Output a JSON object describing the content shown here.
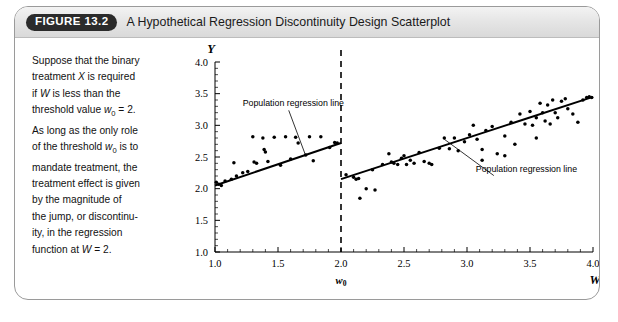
{
  "figure": {
    "badge": "FIGURE 13.2",
    "title": "A Hypothetical Regression Discontinuity Design Scatterplot",
    "caption_lines": [
      "Suppose that the binary",
      "treatment X is required",
      "if W is less than the",
      "threshold value w0 = 2.",
      "As long as the only role",
      "of the threshold w0 is to",
      "mandate treatment, the",
      "treatment effect is given",
      "by the magnitude of",
      "the jump, or discontinu-",
      "ity, in the regression",
      "function at W = 2."
    ]
  },
  "colors": {
    "badge_bg": "#2b2b2b",
    "header_bg": "#e6e6e6",
    "card_border": "#9a9a9a",
    "ink": "#000000"
  },
  "chart_data": {
    "type": "scatter",
    "title": "A Hypothetical Regression Discontinuity Design Scatterplot",
    "xlabel": "W",
    "ylabel": "Y",
    "xlim": [
      1.0,
      4.0
    ],
    "ylim": [
      1.0,
      4.0
    ],
    "xticks": [
      "1.0",
      "1.5",
      "2.0",
      "2.5",
      "3.0",
      "3.5",
      "4.0"
    ],
    "xtick_values": [
      1.0,
      1.5,
      2.0,
      2.5,
      3.0,
      3.5,
      4.0
    ],
    "yticks": [
      "1.0",
      "1.5",
      "2.0",
      "2.5",
      "3.0",
      "3.5",
      "4.0"
    ],
    "ytick_values": [
      1.0,
      1.5,
      2.0,
      2.5,
      3.0,
      3.5,
      4.0
    ],
    "grid": false,
    "threshold": {
      "label": "w0",
      "value": 2.0,
      "style": "dashed-vertical"
    },
    "annotations": [
      {
        "text": "Population regression line",
        "x": 1.22,
        "y": 3.3,
        "pointer_to": [
          1.72,
          2.52
        ]
      },
      {
        "text": "Population regression line",
        "x": 3.07,
        "y": 2.27,
        "pointer_to": [
          2.82,
          2.78
        ]
      }
    ],
    "series": [
      {
        "name": "Population regression line (W < 2)",
        "type": "line",
        "segment": [
          [
            1.0,
            2.05
          ],
          [
            2.0,
            2.72
          ]
        ]
      },
      {
        "name": "Population regression line (W >= 2)",
        "type": "line",
        "segment": [
          [
            2.0,
            2.15
          ],
          [
            4.0,
            3.45
          ]
        ]
      },
      {
        "name": "Observations (W < 2)",
        "type": "scatter",
        "points": [
          [
            1.01,
            2.1
          ],
          [
            1.03,
            2.07
          ],
          [
            1.05,
            2.05
          ],
          [
            1.08,
            2.12
          ],
          [
            1.13,
            2.15
          ],
          [
            1.15,
            2.41
          ],
          [
            1.17,
            2.2
          ],
          [
            1.22,
            2.25
          ],
          [
            1.26,
            2.27
          ],
          [
            1.3,
            2.82
          ],
          [
            1.31,
            2.42
          ],
          [
            1.33,
            2.4
          ],
          [
            1.38,
            2.8
          ],
          [
            1.39,
            2.62
          ],
          [
            1.4,
            2.58
          ],
          [
            1.42,
            2.43
          ],
          [
            1.47,
            2.81
          ],
          [
            1.52,
            2.37
          ],
          [
            1.56,
            2.82
          ],
          [
            1.6,
            2.47
          ],
          [
            1.64,
            2.81
          ],
          [
            1.66,
            2.72
          ],
          [
            1.72,
            2.53
          ],
          [
            1.75,
            2.82
          ],
          [
            1.78,
            2.44
          ],
          [
            1.84,
            2.82
          ],
          [
            1.91,
            2.65
          ],
          [
            1.95,
            2.73
          ],
          [
            1.97,
            2.72
          ]
        ]
      },
      {
        "name": "Observations (W >= 2)",
        "type": "scatter",
        "points": [
          [
            2.04,
            2.22
          ],
          [
            2.1,
            2.18
          ],
          [
            2.12,
            2.15
          ],
          [
            2.14,
            2.16
          ],
          [
            2.15,
            1.85
          ],
          [
            2.2,
            2.0
          ],
          [
            2.25,
            2.3
          ],
          [
            2.27,
            1.98
          ],
          [
            2.33,
            2.38
          ],
          [
            2.38,
            2.55
          ],
          [
            2.4,
            2.42
          ],
          [
            2.42,
            2.4
          ],
          [
            2.45,
            2.38
          ],
          [
            2.48,
            2.48
          ],
          [
            2.5,
            2.52
          ],
          [
            2.52,
            2.38
          ],
          [
            2.55,
            2.45
          ],
          [
            2.58,
            2.4
          ],
          [
            2.62,
            2.57
          ],
          [
            2.66,
            2.43
          ],
          [
            2.7,
            2.4
          ],
          [
            2.72,
            2.38
          ],
          [
            2.78,
            2.64
          ],
          [
            2.82,
            2.8
          ],
          [
            2.86,
            2.63
          ],
          [
            2.9,
            2.8
          ],
          [
            2.93,
            2.6
          ],
          [
            2.98,
            2.74
          ],
          [
            3.02,
            2.85
          ],
          [
            3.05,
            3.0
          ],
          [
            3.08,
            2.78
          ],
          [
            3.12,
            2.62
          ],
          [
            3.15,
            2.92
          ],
          [
            3.2,
            2.98
          ],
          [
            3.24,
            2.55
          ],
          [
            3.3,
            2.83
          ],
          [
            3.35,
            3.05
          ],
          [
            3.38,
            2.7
          ],
          [
            3.42,
            3.18
          ],
          [
            3.46,
            3.02
          ],
          [
            3.5,
            3.22
          ],
          [
            3.52,
            3.0
          ],
          [
            3.55,
            3.12
          ],
          [
            3.58,
            3.35
          ],
          [
            3.6,
            3.2
          ],
          [
            3.62,
            3.07
          ],
          [
            3.64,
            3.32
          ],
          [
            3.66,
            3.02
          ],
          [
            3.68,
            3.4
          ],
          [
            3.7,
            3.2
          ],
          [
            3.72,
            3.12
          ],
          [
            3.75,
            3.38
          ],
          [
            3.78,
            3.42
          ],
          [
            3.8,
            3.26
          ],
          [
            3.84,
            3.18
          ],
          [
            3.88,
            3.05
          ],
          [
            3.92,
            3.4
          ],
          [
            3.95,
            3.44
          ],
          [
            3.97,
            3.45
          ],
          [
            3.99,
            3.44
          ],
          [
            3.3,
            2.52
          ],
          [
            3.12,
            2.45
          ],
          [
            3.55,
            2.8
          ]
        ]
      }
    ]
  }
}
